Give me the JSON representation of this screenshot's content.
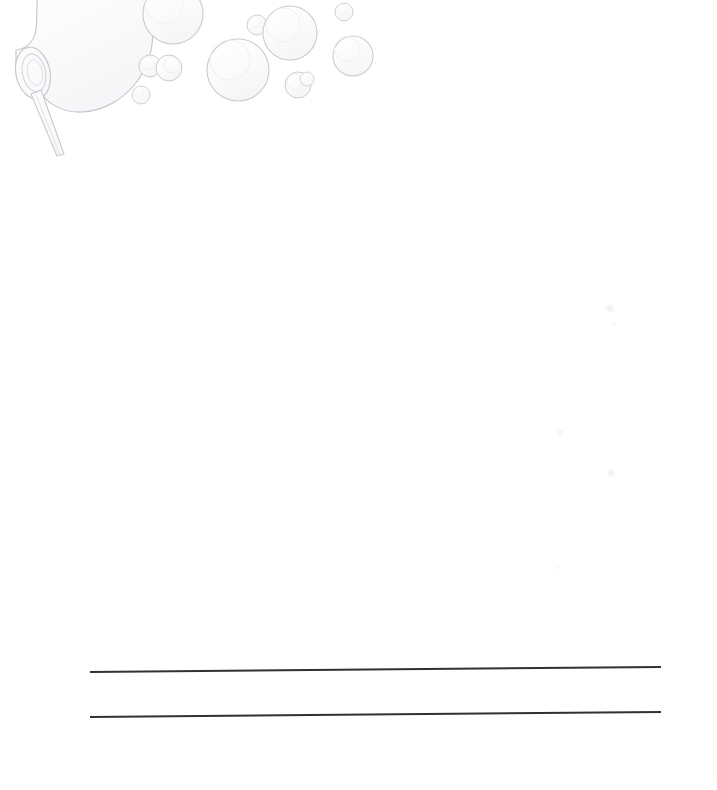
{
  "document": {
    "type": "blank-stationery-scan",
    "title": "Bubble Wand Writing Paper",
    "orientation": "portrait",
    "page_width_px": 717,
    "page_height_px": 790,
    "background_color": "#ffffff",
    "body_text": "",
    "visible_text": []
  },
  "illustration": {
    "name": "bubble-wand-with-bubbles",
    "description": "Faint pencil-line drawing of a bubble wand blowing soap bubbles",
    "line_color": "#c9cbd0",
    "fill_color": "#fbfbfc",
    "position": "top-left",
    "wand": {
      "name": "bubble-wand",
      "ring_center_x": 33,
      "ring_center_y": 73,
      "ring_rx": 17,
      "ring_ry": 26,
      "handle_start_x": 36,
      "handle_start_y": 96,
      "handle_end_x": 62,
      "handle_end_y": 156
    },
    "forming_bubble": {
      "name": "forming-bubble",
      "center_x": 97,
      "center_y": 10,
      "radius": 58
    },
    "bubbles": [
      {
        "name": "bubble-1",
        "cx": 173,
        "cy": 14,
        "r": 30
      },
      {
        "name": "bubble-2",
        "cx": 150,
        "cy": 66,
        "r": 11
      },
      {
        "name": "bubble-3",
        "cx": 169,
        "cy": 68,
        "r": 13
      },
      {
        "name": "bubble-4",
        "cx": 141,
        "cy": 95,
        "r": 9
      },
      {
        "name": "bubble-5",
        "cx": 238,
        "cy": 70,
        "r": 31
      },
      {
        "name": "bubble-6",
        "cx": 257,
        "cy": 25,
        "r": 10
      },
      {
        "name": "bubble-7",
        "cx": 290,
        "cy": 33,
        "r": 27
      },
      {
        "name": "bubble-8",
        "cx": 298,
        "cy": 85,
        "r": 13
      },
      {
        "name": "bubble-9",
        "cx": 307,
        "cy": 79,
        "r": 7
      },
      {
        "name": "bubble-10",
        "cx": 344,
        "cy": 12,
        "r": 9
      },
      {
        "name": "bubble-11",
        "cx": 353,
        "cy": 56,
        "r": 20
      }
    ]
  },
  "rules": {
    "name": "writing-lines",
    "color": "#303035",
    "count": 2,
    "lines": [
      {
        "name": "writing-line-1",
        "x1": 90,
        "y1": 672,
        "x2": 661,
        "y2": 667,
        "thickness": 2.0
      },
      {
        "name": "writing-line-2",
        "x1": 90,
        "y1": 717,
        "x2": 661,
        "y2": 712,
        "thickness": 2.0
      }
    ]
  },
  "scan_artifacts": {
    "name": "scan-specks",
    "color": "#f1f1f3",
    "specks": [
      {
        "x": 606,
        "y": 305,
        "size": 7
      },
      {
        "x": 613,
        "y": 323,
        "size": 3
      },
      {
        "x": 558,
        "y": 430,
        "size": 5
      },
      {
        "x": 608,
        "y": 470,
        "size": 6
      },
      {
        "x": 556,
        "y": 566,
        "size": 3
      }
    ]
  }
}
